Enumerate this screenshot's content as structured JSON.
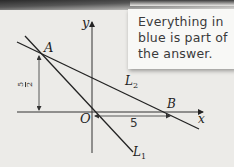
{
  "callout": {
    "lines": [
      "Everything in",
      "blue is part of",
      "the answer."
    ]
  },
  "diagram": {
    "axes": {
      "x_label": "x",
      "y_label": "y",
      "origin_label": "O"
    },
    "points": {
      "A": "A",
      "B": "B"
    },
    "lines": {
      "L1": {
        "name": "L",
        "sub": "1"
      },
      "L2": {
        "name": "L",
        "sub": "2"
      }
    },
    "dimensions": {
      "vertical": {
        "numerator": "5",
        "denominator": "2"
      },
      "horizontal": "5"
    }
  }
}
